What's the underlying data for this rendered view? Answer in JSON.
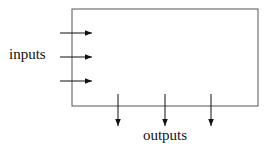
{
  "diagram": {
    "type": "block-diagram",
    "box": {
      "x": 72,
      "y": 9,
      "width": 186,
      "height": 97,
      "stroke": "#555555"
    },
    "inputs": {
      "label": "inputs",
      "label_pos": {
        "x": 9,
        "y": 59
      },
      "arrows": [
        {
          "x1": 60,
          "y1": 33,
          "x2": 92,
          "y2": 33
        },
        {
          "x1": 60,
          "y1": 57,
          "x2": 92,
          "y2": 57
        },
        {
          "x1": 60,
          "y1": 81,
          "x2": 92,
          "y2": 81
        }
      ]
    },
    "outputs": {
      "label": "outputs",
      "label_pos": {
        "x": 165,
        "y": 140
      },
      "arrows": [
        {
          "x1": 118,
          "y1": 94,
          "x2": 118,
          "y2": 126
        },
        {
          "x1": 165,
          "y1": 94,
          "x2": 165,
          "y2": 126
        },
        {
          "x1": 211,
          "y1": 94,
          "x2": 211,
          "y2": 126
        }
      ]
    },
    "colors": {
      "line": "#111111",
      "box": "#555555",
      "background": "#ffffff"
    }
  }
}
